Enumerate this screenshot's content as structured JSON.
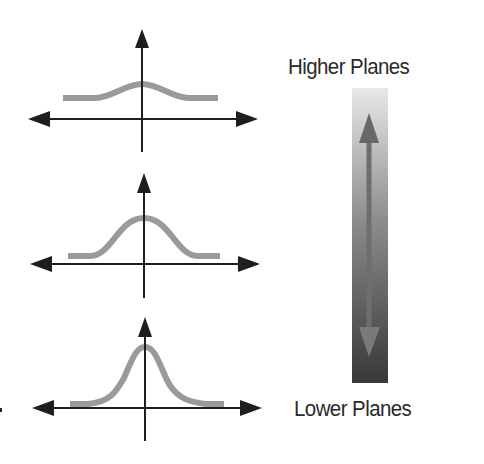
{
  "labels": {
    "top": "Higher Planes",
    "bottom": "Lower Planes"
  },
  "colors": {
    "axis": "#1e1e1e",
    "curve": "#9a9a9a",
    "gradient_top": "#e8e8e8",
    "gradient_mid": "#8c8c8c",
    "gradient_bottom": "#383838",
    "arrow_up": "#686868",
    "arrow_down": "#7a7a7a",
    "text": "#2a2a2a"
  },
  "plots": [
    {
      "name": "flat-distribution",
      "axis_x": 142,
      "axis_y_top": 29,
      "axis_y_bottom": 152,
      "h_axis_y": 119,
      "h_axis_left": 28,
      "h_axis_right": 258,
      "curve_left": 63,
      "curve_right": 218,
      "curve_baseline": 98,
      "curve_peak": 84
    },
    {
      "name": "medium-distribution",
      "axis_x": 144,
      "axis_y_top": 173,
      "axis_y_bottom": 298,
      "h_axis_y": 264,
      "h_axis_left": 30,
      "h_axis_right": 260,
      "curve_left": 68,
      "curve_right": 220,
      "curve_baseline": 256,
      "curve_peak": 218
    },
    {
      "name": "peaked-distribution",
      "axis_x": 145,
      "axis_y_top": 317,
      "axis_y_bottom": 441,
      "h_axis_y": 408,
      "h_axis_left": 32,
      "h_axis_right": 262,
      "curve_left": 70,
      "curve_right": 224,
      "curve_baseline": 404,
      "curve_peak": 347
    }
  ],
  "gradient_bar": {
    "x": 352,
    "y": 88,
    "width": 36,
    "height": 295,
    "arrow_x": 369,
    "arrow_top_tip": 113,
    "arrow_bottom_tip": 357
  }
}
